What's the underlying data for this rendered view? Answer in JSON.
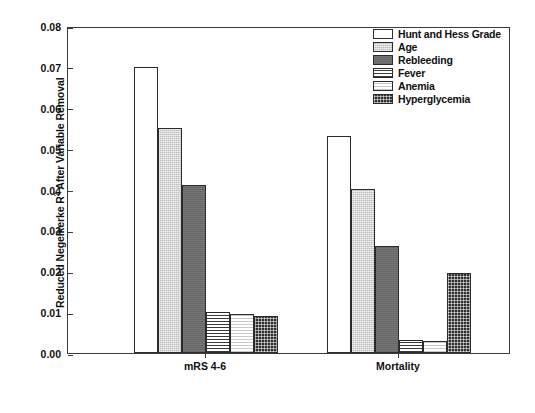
{
  "chart_data": {
    "type": "bar",
    "title": "",
    "xlabel": "",
    "ylabel": "Reduced Negelkerke R² After Variable Removal",
    "ylabel_main": "Reduced Negelkerke R",
    "ylabel_sup": "2",
    "ylabel_tail": " After Variable Removal",
    "categories": [
      "mRS 4-6",
      "Mortality"
    ],
    "ylim": [
      0.0,
      0.08
    ],
    "ytick_labels": [
      "0.00",
      "0.01",
      "0.02",
      "0.03",
      "0.04",
      "0.05",
      "0.06",
      "0.07",
      "0.08"
    ],
    "ytick_values": [
      0.0,
      0.01,
      0.02,
      0.03,
      0.04,
      0.05,
      0.06,
      0.07,
      0.08
    ],
    "grid": false,
    "legend_position": "top-right",
    "series": [
      {
        "name": "Hunt and Hess Grade",
        "pattern": "empty",
        "color": "#ffffff",
        "values": [
          0.07,
          0.053
        ]
      },
      {
        "name": "Age",
        "pattern": "lightspeckle",
        "color": "#bdbdbd",
        "values": [
          0.055,
          0.0402
        ]
      },
      {
        "name": "Rebleeding",
        "pattern": "solid-dark",
        "color": "#6f6f6f",
        "values": [
          0.041,
          0.0261
        ]
      },
      {
        "name": "Fever",
        "pattern": "hlines",
        "color": "#3a3a3a",
        "values": [
          0.01,
          0.0031
        ]
      },
      {
        "name": "Anemia",
        "pattern": "lightgrid",
        "color": "#c8c8c8",
        "values": [
          0.0095,
          0.003
        ]
      },
      {
        "name": "Hyperglycemia",
        "pattern": "crosshatch",
        "color": "#2e2e2e",
        "values": [
          0.009,
          0.0195
        ]
      }
    ]
  },
  "caption": {
    "text": ""
  }
}
